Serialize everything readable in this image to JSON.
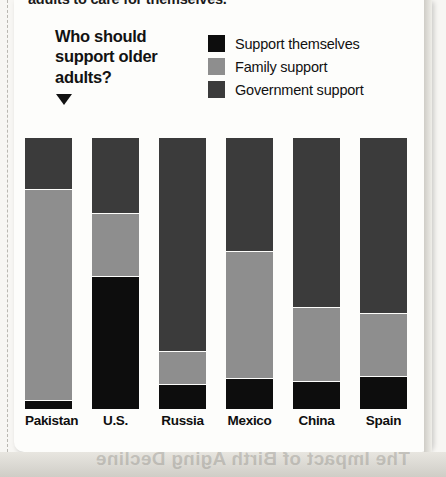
{
  "page": {
    "cutoff_headline": "adults to care for themselves.",
    "ghost_bleed_text": "The Impact of Birth Aging Decline"
  },
  "chart": {
    "title_line1": "Who should",
    "title_line2": "support older",
    "title_line3": "adults?",
    "caret_icon": "triangle-down-icon",
    "legend": [
      {
        "label": "Support themselves",
        "color": "#0d0d0d",
        "key": "self"
      },
      {
        "label": "Family support",
        "color": "#8e8e8e",
        "key": "family"
      },
      {
        "label": "Government support",
        "color": "#3b3b3b",
        "key": "government"
      }
    ]
  },
  "chart_data": {
    "type": "bar",
    "subtype": "stacked-100",
    "title": "Who should support older adults?",
    "xlabel": "",
    "ylabel": "",
    "ylim": [
      0,
      100
    ],
    "grid": false,
    "legend_position": "top-right",
    "categories": [
      "Pakistan",
      "U.S.",
      "Russia",
      "Mexico",
      "China",
      "Spain"
    ],
    "series": [
      {
        "name": "Government support",
        "color": "#3b3b3b",
        "values": [
          19,
          28,
          79,
          42,
          63,
          65
        ]
      },
      {
        "name": "Family support",
        "color": "#8e8e8e",
        "values": [
          78,
          23,
          12,
          47,
          27,
          23
        ]
      },
      {
        "name": "Support themselves",
        "color": "#0d0d0d",
        "values": [
          3,
          49,
          9,
          11,
          10,
          12
        ]
      }
    ],
    "bars": [
      {
        "category": "Pakistan",
        "government": 19,
        "family": 78,
        "self": 3
      },
      {
        "category": "U.S.",
        "government": 28,
        "family": 23,
        "self": 49
      },
      {
        "category": "Russia",
        "government": 79,
        "family": 12,
        "self": 9
      },
      {
        "category": "Mexico",
        "government": 42,
        "family": 47,
        "self": 11
      },
      {
        "category": "China",
        "government": 63,
        "family": 27,
        "self": 10
      },
      {
        "category": "Spain",
        "government": 65,
        "family": 23,
        "self": 12
      }
    ]
  }
}
